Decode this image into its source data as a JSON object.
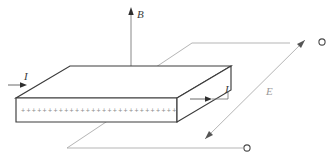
{
  "figure": {
    "type": "physics-schematic"
  },
  "labels": {
    "magnetic_field": "B",
    "current_left": "I",
    "current_right": "I",
    "electric_field": "E",
    "charge_marker": "+"
  },
  "annotations": {
    "charge_row_count": 29,
    "charge_row_symbol": "+"
  },
  "colors": {
    "edge_solid": "#3c3c3c",
    "edge_hidden": "#9d9d9d",
    "wire": "#a8a8a8",
    "label_text": "#3a3a3a",
    "label_faint": "#9a9a9a",
    "background": "#ffffff"
  },
  "geometry": {
    "slab_top_face": "parallelogram",
    "projection": "oblique",
    "field_direction_B": "up",
    "field_direction_E": "up-right"
  }
}
